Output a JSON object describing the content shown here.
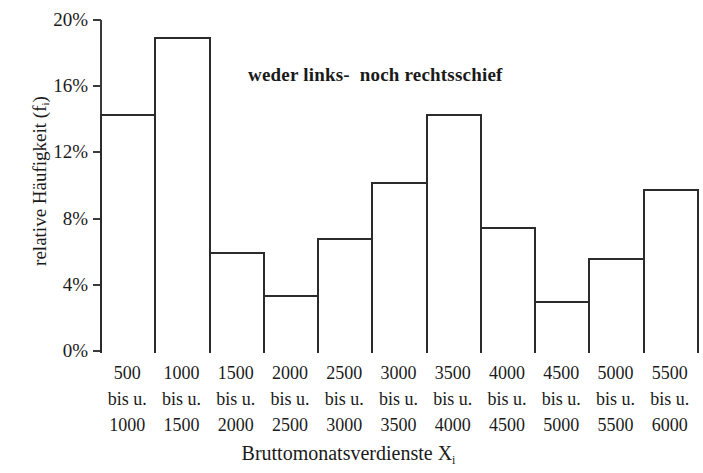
{
  "chart_data": {
    "type": "bar",
    "title": "",
    "subtitle": "",
    "xlabel": "Bruttomonatsverdienste X",
    "xlabel_sub": "i",
    "ylabel": "relative Häufigkeit (f",
    "ylabel_sub": "i",
    "ylabel_tail": ")",
    "annotation": "weder links-  noch rechtsschief",
    "grid": false,
    "legend": "none",
    "ylim": [
      0,
      20
    ],
    "ytick_values": [
      20,
      16,
      12,
      8,
      4,
      0
    ],
    "ytick_labels": [
      "20%",
      "16%",
      "12%",
      "8%",
      "4%",
      "0%"
    ],
    "categories": [
      "500 bis u. 1000",
      "1000 bis u. 1500",
      "1500 bis u. 2000",
      "2000 bis u. 2500",
      "2500 bis u. 3000",
      "3000 bis u. 3500",
      "3500 bis u. 4000",
      "4000 bis u. 4500",
      "4500 bis u. 5000",
      "5000 bis u. 5500",
      "5500 bis u. 6000"
    ],
    "category_parts": [
      {
        "from": "500",
        "mid": "bis u.",
        "to": "1000"
      },
      {
        "from": "1000",
        "mid": "bis u.",
        "to": "1500"
      },
      {
        "from": "1500",
        "mid": "bis u.",
        "to": "2000"
      },
      {
        "from": "2000",
        "mid": "bis u.",
        "to": "2500"
      },
      {
        "from": "2500",
        "mid": "bis u.",
        "to": "3000"
      },
      {
        "from": "3000",
        "mid": "bis u.",
        "to": "3500"
      },
      {
        "from": "3500",
        "mid": "bis u.",
        "to": "4000"
      },
      {
        "from": "4000",
        "mid": "bis u.",
        "to": "4500"
      },
      {
        "from": "4500",
        "mid": "bis u.",
        "to": "5000"
      },
      {
        "from": "5000",
        "mid": "bis u.",
        "to": "5500"
      },
      {
        "from": "5500",
        "mid": "bis u.",
        "to": "6000"
      }
    ],
    "values": [
      14.3,
      19.0,
      6.0,
      3.4,
      6.8,
      10.2,
      14.3,
      7.5,
      3.0,
      5.6,
      9.8
    ],
    "colors": {
      "bar_fill": "#ffffff",
      "bar_stroke": "#2b2b2b",
      "axis": "#3a3a3a",
      "text": "#1a1a1a",
      "background": "#ffffff"
    }
  }
}
